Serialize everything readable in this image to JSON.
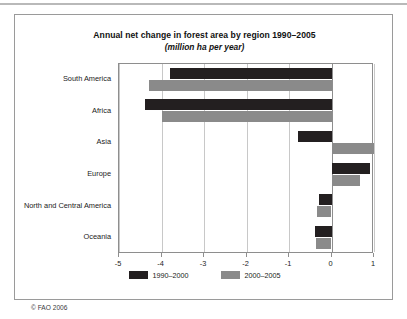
{
  "chart_data": {
    "type": "bar",
    "orientation": "horizontal",
    "title": "Annual net change in forest area by region 1990–2005",
    "subtitle": "(million ha per year)",
    "xlabel": "",
    "ylabel": "",
    "xlim": [
      -5,
      1
    ],
    "xticks": [
      "-5",
      "-4",
      "-3",
      "-2",
      "-1",
      "0",
      "1"
    ],
    "xtick_values": [
      -5,
      -4,
      -3,
      -2,
      -1,
      0,
      1
    ],
    "grid": true,
    "grid_axis": "x",
    "legend_position": "bottom",
    "categories": [
      "South America",
      "Africa",
      "Asia",
      "Europe",
      "North and Central America",
      "Oceania"
    ],
    "series": [
      {
        "name": "1990–2000",
        "color": "#231f20",
        "values": [
          -3.8,
          -4.4,
          -0.8,
          0.9,
          -0.3,
          -0.4
        ]
      },
      {
        "name": "2000–2005",
        "color": "#8a8a8a",
        "values": [
          -4.3,
          -4.0,
          1.0,
          0.66,
          -0.33,
          -0.36
        ]
      }
    ]
  },
  "credit": "© FAO 2006"
}
